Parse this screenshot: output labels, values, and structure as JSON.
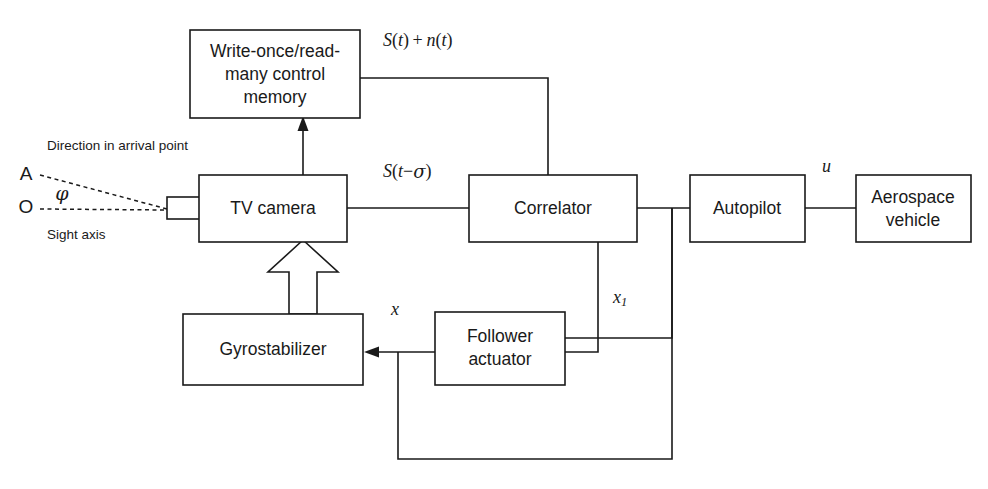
{
  "diagram": {
    "stroke_color": "#1a1a1a",
    "background_color": "#ffffff",
    "boxes": [
      {
        "id": "memory",
        "name": "write-once-read-many-control-memory",
        "lines": [
          "Write-once/read-",
          "many control",
          "memory"
        ]
      },
      {
        "id": "tv_camera",
        "name": "tv-camera",
        "lines": [
          "TV camera"
        ]
      },
      {
        "id": "correlator",
        "name": "correlator",
        "lines": [
          "Correlator"
        ]
      },
      {
        "id": "autopilot",
        "name": "autopilot",
        "lines": [
          "Autopilot"
        ]
      },
      {
        "id": "aerospace_vehicle",
        "name": "aerospace-vehicle",
        "lines": [
          "Aerospace",
          "vehicle"
        ]
      },
      {
        "id": "gyrostabilizer",
        "name": "gyrostabilizer",
        "lines": [
          "Gyrostabilizer"
        ]
      },
      {
        "id": "follower_actuator",
        "name": "follower-actuator",
        "lines": [
          "Follower",
          "actuator"
        ]
      }
    ],
    "signal_labels": {
      "s_plus_n": "S(t) + n(t)",
      "s_delayed": "S(t−σ)",
      "u": "u",
      "x": "x",
      "x1": "x1"
    },
    "annotations": {
      "direction_in_arrival_point": "Direction in arrival point",
      "sight_axis": "Sight axis",
      "point_a": "A",
      "point_o": "O",
      "angle_phi": "φ"
    }
  }
}
